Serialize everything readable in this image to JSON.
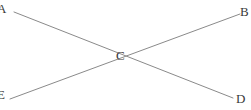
{
  "diagram": {
    "type": "line-intersection",
    "background_color": "#ffffff",
    "line_color": "#8a8a8a",
    "label_color": "#3a3a3a",
    "line_width": 1,
    "points": [
      {
        "id": "A",
        "label": "A",
        "x": 6,
        "y": 9,
        "clipped": "left"
      },
      {
        "id": "B",
        "label": "B",
        "x": 245,
        "y": 12,
        "clipped": "right"
      },
      {
        "id": "C",
        "label": "C",
        "x": 121,
        "y": 56,
        "clipped": "none"
      },
      {
        "id": "D",
        "label": "D",
        "x": 241,
        "y": 99,
        "clipped": "none"
      },
      {
        "id": "E",
        "label": "E",
        "x": 2,
        "y": 95,
        "clipped": "left"
      }
    ],
    "segments": [
      {
        "id": "AD",
        "from": "A",
        "to": "D",
        "x1": 14,
        "y1": 12,
        "x2": 233,
        "y2": 98
      },
      {
        "id": "EB",
        "from": "E",
        "to": "B",
        "x1": 10,
        "y1": 99,
        "x2": 240,
        "y2": 14
      }
    ]
  }
}
